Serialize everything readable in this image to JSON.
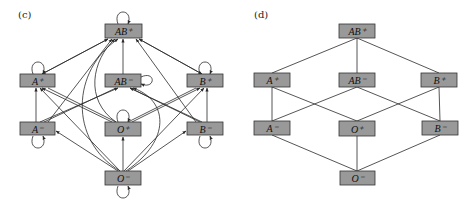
{
  "panels": {
    "c": {
      "label": "(c)",
      "description": "Directed compatibility graph of blood types with self-loops",
      "nodes": {
        "ABp": {
          "label": "AB⁺"
        },
        "Ap": {
          "label": "A⁺"
        },
        "ABm": {
          "label": "AB⁻"
        },
        "Bp": {
          "label": "B⁺"
        },
        "Am": {
          "label": "A⁻"
        },
        "Op": {
          "label": "O⁺"
        },
        "Bm": {
          "label": "B⁻"
        },
        "Om": {
          "label": "O⁻"
        }
      },
      "edges": [
        [
          "Ap",
          "ABp"
        ],
        [
          "ABm",
          "ABp"
        ],
        [
          "Bp",
          "ABp"
        ],
        [
          "Am",
          "ABp"
        ],
        [
          "Op",
          "ABp"
        ],
        [
          "Bm",
          "ABp"
        ],
        [
          "Om",
          "ABp"
        ],
        [
          "Am",
          "Ap"
        ],
        [
          "Op",
          "Ap"
        ],
        [
          "Om",
          "Ap"
        ],
        [
          "Am",
          "ABm"
        ],
        [
          "Bm",
          "ABm"
        ],
        [
          "Om",
          "ABm"
        ],
        [
          "Bm",
          "Bp"
        ],
        [
          "Op",
          "Bp"
        ],
        [
          "Om",
          "Bp"
        ],
        [
          "Om",
          "Am"
        ],
        [
          "Om",
          "Op"
        ],
        [
          "Om",
          "Bm"
        ]
      ],
      "self_loops": [
        "ABp",
        "Ap",
        "ABm",
        "Bp",
        "Am",
        "Op",
        "Bm",
        "Om"
      ]
    },
    "d": {
      "label": "(d)",
      "description": "Hasse diagram of blood type compatibility partial order",
      "nodes": {
        "ABp": {
          "label": "AB⁺"
        },
        "Ap": {
          "label": "A⁺"
        },
        "ABm": {
          "label": "AB⁻"
        },
        "Bp": {
          "label": "B⁺"
        },
        "Am": {
          "label": "A⁻"
        },
        "Op": {
          "label": "O⁺"
        },
        "Bm": {
          "label": "B⁻"
        },
        "Om": {
          "label": "O⁻"
        }
      },
      "edges": [
        [
          "ABp",
          "Ap"
        ],
        [
          "ABp",
          "ABm"
        ],
        [
          "ABp",
          "Bp"
        ],
        [
          "Ap",
          "Am"
        ],
        [
          "Ap",
          "Op"
        ],
        [
          "ABm",
          "Am"
        ],
        [
          "ABm",
          "Bm"
        ],
        [
          "Bp",
          "Op"
        ],
        [
          "Bp",
          "Bm"
        ],
        [
          "Am",
          "Om"
        ],
        [
          "Op",
          "Om"
        ],
        [
          "Bm",
          "Om"
        ]
      ]
    }
  }
}
